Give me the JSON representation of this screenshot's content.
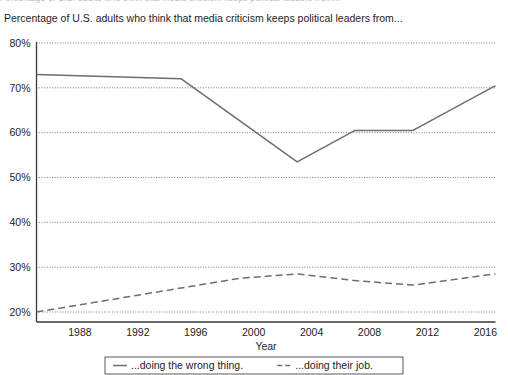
{
  "clipped_header": {
    "text": "Percentage of U.S. adults who think that media criticism keeps political leaders from..."
  },
  "chart_title": "Percentage of U.S. adults who think that media criticism keeps political leaders from...",
  "chart_data": {
    "type": "line",
    "title": "Percentage of U.S. adults who think that media criticism keeps political leaders from...",
    "xlabel": "Year",
    "ylabel": "",
    "xlim": [
      1985.0,
      2016.7
    ],
    "ylim": [
      19.0,
      80.5
    ],
    "xticks": [
      1988,
      1992,
      1996,
      2000,
      2004,
      2008,
      2012,
      2016
    ],
    "xtick_labels": [
      "1988",
      "1992",
      "1996",
      "2000",
      "2004",
      "2008",
      "2012",
      "2016"
    ],
    "yticks": [
      20,
      30,
      40,
      50,
      60,
      70,
      80
    ],
    "ytick_labels": [
      "20%",
      "30%",
      "40%",
      "50%",
      "60%",
      "70%",
      "80%"
    ],
    "grid": true,
    "grid_axis": "y",
    "grid_style": "dotted",
    "legend_position": "bottom",
    "series": [
      {
        "name": "...doing the wrong thing.",
        "style": "solid",
        "color": "#6e6e6e",
        "x": [
          1985,
          1995,
          2003,
          2007,
          2011,
          2016.7
        ],
        "values": [
          73.0,
          72.0,
          53.5,
          60.5,
          60.5,
          70.5
        ]
      },
      {
        "name": "...doing their job.",
        "style": "dashed",
        "color": "#6e6e6e",
        "x": [
          1985,
          1999,
          2003,
          2007,
          2011,
          2016.7
        ],
        "values": [
          20.0,
          27.5,
          28.5,
          27.0,
          26.0,
          28.5
        ]
      }
    ]
  },
  "legend": {
    "entries": [
      {
        "label": "...doing the wrong thing.",
        "style": "solid"
      },
      {
        "label": "...doing their job.",
        "style": "dashed"
      }
    ]
  }
}
